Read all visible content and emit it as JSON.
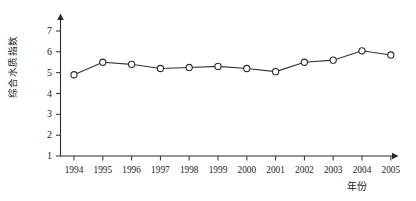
{
  "chart_data": {
    "type": "line",
    "title": "",
    "subtitle": "",
    "xlabel": "年份",
    "ylabel": "综合水质指数",
    "categories": [
      "1994",
      "1995",
      "1996",
      "1997",
      "1998",
      "1999",
      "2000",
      "2001",
      "2002",
      "2003",
      "2004",
      "2005"
    ],
    "values": [
      4.9,
      5.5,
      5.4,
      5.2,
      5.25,
      5.3,
      5.2,
      5.05,
      5.5,
      5.6,
      6.05,
      5.85
    ],
    "series": [
      {
        "name": "综合水质指数",
        "values": [
          4.9,
          5.5,
          5.4,
          5.2,
          5.25,
          5.3,
          5.2,
          5.05,
          5.5,
          5.6,
          6.05,
          5.85
        ]
      }
    ],
    "ylim": [
      1,
      7
    ],
    "ytick_labels": [
      "1",
      "2",
      "3",
      "4",
      "5",
      "6",
      "7"
    ],
    "ytick_values": [
      1,
      2,
      3,
      4,
      5,
      6,
      7
    ],
    "xtick_labels": [
      "1994",
      "1995",
      "1996",
      "1997",
      "1998",
      "1999",
      "2000",
      "2001",
      "2002",
      "2003",
      "2004",
      "2005"
    ],
    "grid": false,
    "legend": false,
    "legend_position": "none",
    "marker": "circle-open",
    "line_color": "#333333",
    "marker_fill": "#ffffff",
    "marker_edge_color": "#2b2b2b",
    "axis_color": "#2b2b2b",
    "background_color": "#ffffff",
    "axis_arrows": true,
    "annotations": []
  }
}
